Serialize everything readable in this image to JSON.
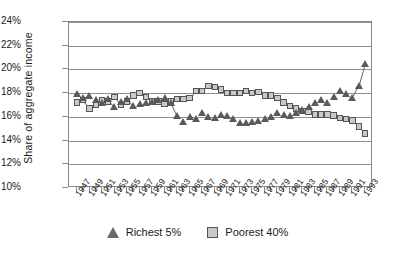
{
  "chart_data": {
    "type": "scatter",
    "title": "",
    "xlabel": "",
    "ylabel": "Share of aggregate income",
    "ylim": [
      10,
      24
    ],
    "ytick_labels": [
      "24%",
      "22%",
      "20%",
      "18%",
      "16%",
      "14%",
      "12%",
      "10%"
    ],
    "ytick_values": [
      24,
      22,
      20,
      18,
      16,
      14,
      12,
      10
    ],
    "grid": true,
    "legend_position": "bottom-center",
    "x": [
      1947,
      1948,
      1949,
      1950,
      1951,
      1952,
      1953,
      1954,
      1955,
      1956,
      1957,
      1958,
      1959,
      1960,
      1961,
      1962,
      1963,
      1964,
      1965,
      1966,
      1967,
      1968,
      1969,
      1970,
      1971,
      1972,
      1973,
      1974,
      1975,
      1976,
      1977,
      1978,
      1979,
      1980,
      1981,
      1982,
      1983,
      1984,
      1985,
      1986,
      1987,
      1988,
      1989,
      1990,
      1991,
      1992,
      1993
    ],
    "xtick_labels": [
      "1947",
      "1949",
      "1951",
      "1953",
      "1955",
      "1957",
      "1959",
      "1961",
      "1963",
      "1965",
      "1967",
      "1969",
      "1971",
      "1973",
      "1975",
      "1977",
      "1979",
      "1981",
      "1983",
      "1985",
      "1987",
      "1989",
      "1991",
      "1993"
    ],
    "series": [
      {
        "name": "Richest 5%",
        "marker": "triangle",
        "color": "#5a5a5a",
        "values": [
          17.9,
          17.6,
          17.8,
          17.4,
          17.2,
          17.5,
          16.8,
          17.3,
          17.5,
          16.9,
          17.1,
          17.2,
          17.3,
          17.4,
          17.6,
          17.2,
          16.1,
          15.6,
          16.0,
          15.8,
          16.3,
          16.0,
          15.9,
          16.2,
          16.1,
          15.8,
          15.5,
          15.5,
          15.6,
          15.7,
          15.8,
          16.0,
          16.3,
          16.2,
          16.1,
          16.3,
          16.6,
          16.8,
          17.2,
          17.4,
          17.2,
          17.7,
          18.2,
          17.9,
          17.6,
          18.6,
          20.5
        ]
      },
      {
        "name": "Poorest 40%",
        "marker": "square",
        "color": "#c9c9c9",
        "values": [
          17.2,
          17.4,
          16.7,
          17.0,
          17.4,
          17.3,
          17.7,
          17.0,
          17.3,
          17.8,
          18.0,
          17.7,
          17.3,
          17.3,
          17.1,
          17.3,
          17.5,
          17.5,
          17.6,
          18.2,
          18.2,
          18.6,
          18.5,
          18.3,
          18.0,
          18.0,
          18.0,
          18.2,
          18.0,
          18.1,
          17.8,
          17.8,
          17.6,
          17.2,
          16.9,
          16.7,
          16.5,
          16.4,
          16.2,
          16.2,
          16.2,
          16.1,
          15.9,
          15.8,
          15.7,
          15.2,
          14.6
        ]
      }
    ]
  },
  "axis": {
    "y_title": "Share of aggregate income"
  },
  "legend": {
    "items": [
      {
        "label": "Richest 5%",
        "marker": "triangle-icon"
      },
      {
        "label": "Poorest 40%",
        "marker": "square-icon"
      }
    ]
  }
}
